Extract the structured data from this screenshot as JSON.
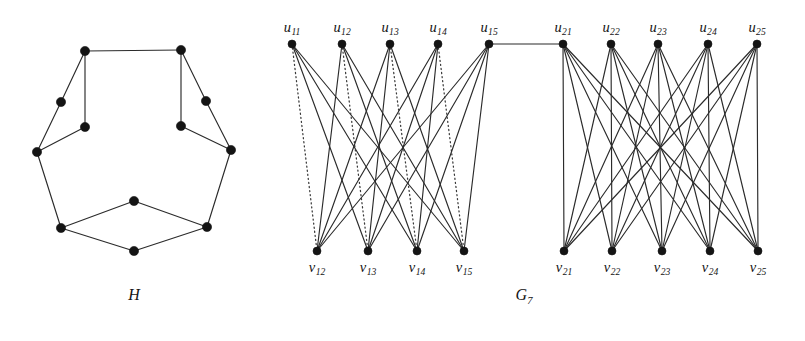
{
  "figure": {
    "background_color": "#ffffff",
    "vertex_color": "#141414",
    "edge_color": "#2b2b2b",
    "dotted_edge_color": "#3a3a3a",
    "width": 805,
    "height": 341
  },
  "captions": [
    {
      "id": "caption-H",
      "base": "H",
      "sub": "",
      "x": 134,
      "y": 286
    },
    {
      "id": "caption-G7",
      "base": "G",
      "sub": "7",
      "x": 524,
      "y": 286
    }
  ],
  "graph_H": {
    "name": "H",
    "caption_base": "H",
    "vertex_count": 12,
    "edge_count": 13,
    "vertices": [
      {
        "id": "h1",
        "x": 85,
        "y": 51
      },
      {
        "id": "h2",
        "x": 181,
        "y": 50
      },
      {
        "id": "h3",
        "x": 61,
        "y": 102
      },
      {
        "id": "h4",
        "x": 206,
        "y": 101
      },
      {
        "id": "h5",
        "x": 85,
        "y": 127
      },
      {
        "id": "h6",
        "x": 181,
        "y": 126
      },
      {
        "id": "h7",
        "x": 37,
        "y": 152
      },
      {
        "id": "h8",
        "x": 231,
        "y": 150
      },
      {
        "id": "h9",
        "x": 61,
        "y": 228
      },
      {
        "id": "h10",
        "x": 207,
        "y": 227
      },
      {
        "id": "h11",
        "x": 134,
        "y": 201
      },
      {
        "id": "h12",
        "x": 134,
        "y": 251
      }
    ],
    "edges": [
      {
        "from": "h1",
        "to": "h2",
        "style": "solid"
      },
      {
        "from": "h1",
        "to": "h3",
        "style": "solid"
      },
      {
        "from": "h1",
        "to": "h5",
        "style": "solid"
      },
      {
        "from": "h2",
        "to": "h4",
        "style": "solid"
      },
      {
        "from": "h2",
        "to": "h6",
        "style": "solid"
      },
      {
        "from": "h3",
        "to": "h7",
        "style": "solid"
      },
      {
        "from": "h5",
        "to": "h7",
        "style": "solid"
      },
      {
        "from": "h4",
        "to": "h8",
        "style": "solid"
      },
      {
        "from": "h6",
        "to": "h8",
        "style": "solid"
      },
      {
        "from": "h7",
        "to": "h9",
        "style": "solid"
      },
      {
        "from": "h8",
        "to": "h10",
        "style": "solid"
      },
      {
        "from": "h9",
        "to": "h11",
        "style": "solid"
      },
      {
        "from": "h9",
        "to": "h12",
        "style": "solid"
      },
      {
        "from": "h10",
        "to": "h11",
        "style": "solid"
      },
      {
        "from": "h10",
        "to": "h12",
        "style": "solid"
      }
    ]
  },
  "graph_G7": {
    "name": "G7",
    "caption_base": "G",
    "caption_sub": "7",
    "vertices": [
      {
        "id": "u11",
        "label_base": "u",
        "label_sub": "11",
        "x": 292,
        "y": 44,
        "label_x": 292,
        "label_y": 19,
        "group": "top-left"
      },
      {
        "id": "u12",
        "label_base": "u",
        "label_sub": "12",
        "x": 342,
        "y": 44,
        "label_x": 342,
        "label_y": 19,
        "group": "top-left"
      },
      {
        "id": "u13",
        "label_base": "u",
        "label_sub": "13",
        "x": 390,
        "y": 44,
        "label_x": 390,
        "label_y": 19,
        "group": "top-left"
      },
      {
        "id": "u14",
        "label_base": "u",
        "label_sub": "14",
        "x": 438,
        "y": 44,
        "label_x": 438,
        "label_y": 19,
        "group": "top-left"
      },
      {
        "id": "u15",
        "label_base": "u",
        "label_sub": "15",
        "x": 489,
        "y": 44,
        "label_x": 489,
        "label_y": 19,
        "group": "top-left"
      },
      {
        "id": "u21",
        "label_base": "u",
        "label_sub": "21",
        "x": 563,
        "y": 44,
        "label_x": 563,
        "label_y": 19,
        "group": "top-right"
      },
      {
        "id": "u22",
        "label_base": "u",
        "label_sub": "22",
        "x": 611,
        "y": 44,
        "label_x": 611,
        "label_y": 19,
        "group": "top-right"
      },
      {
        "id": "u23",
        "label_base": "u",
        "label_sub": "23",
        "x": 658,
        "y": 44,
        "label_x": 658,
        "label_y": 19,
        "group": "top-right"
      },
      {
        "id": "u24",
        "label_base": "u",
        "label_sub": "24",
        "x": 708,
        "y": 44,
        "label_x": 708,
        "label_y": 19,
        "group": "top-right"
      },
      {
        "id": "u25",
        "label_base": "u",
        "label_sub": "25",
        "x": 757,
        "y": 44,
        "label_x": 757,
        "label_y": 19,
        "group": "top-right"
      },
      {
        "id": "v12",
        "label_base": "v",
        "label_sub": "12",
        "x": 317,
        "y": 251,
        "label_x": 317,
        "label_y": 259,
        "group": "bottom-left"
      },
      {
        "id": "v13",
        "label_base": "v",
        "label_sub": "13",
        "x": 368,
        "y": 251,
        "label_x": 368,
        "label_y": 259,
        "group": "bottom-left"
      },
      {
        "id": "v14",
        "label_base": "v",
        "label_sub": "14",
        "x": 417,
        "y": 251,
        "label_x": 417,
        "label_y": 259,
        "group": "bottom-left"
      },
      {
        "id": "v15",
        "label_base": "v",
        "label_sub": "15",
        "x": 464,
        "y": 251,
        "label_x": 464,
        "label_y": 259,
        "group": "bottom-left"
      },
      {
        "id": "v21",
        "label_base": "v",
        "label_sub": "21",
        "x": 564,
        "y": 251,
        "label_x": 564,
        "label_y": 259,
        "group": "bottom-right"
      },
      {
        "id": "v22",
        "label_base": "v",
        "label_sub": "22",
        "x": 612,
        "y": 251,
        "label_x": 612,
        "label_y": 259,
        "group": "bottom-right"
      },
      {
        "id": "v23",
        "label_base": "v",
        "label_sub": "23",
        "x": 662,
        "y": 251,
        "label_x": 662,
        "label_y": 259,
        "group": "bottom-right"
      },
      {
        "id": "v24",
        "label_base": "v",
        "label_sub": "24",
        "x": 710,
        "y": 251,
        "label_x": 710,
        "label_y": 259,
        "group": "bottom-right"
      },
      {
        "id": "v25",
        "label_base": "v",
        "label_sub": "25",
        "x": 758,
        "y": 251,
        "label_x": 758,
        "label_y": 259,
        "group": "bottom-right"
      }
    ],
    "edges": [
      {
        "from": "u11",
        "to": "v12",
        "style": "dotted"
      },
      {
        "from": "u11",
        "to": "v13",
        "style": "solid"
      },
      {
        "from": "u11",
        "to": "v14",
        "style": "solid"
      },
      {
        "from": "u11",
        "to": "v15",
        "style": "solid"
      },
      {
        "from": "u12",
        "to": "v12",
        "style": "solid"
      },
      {
        "from": "u12",
        "to": "v13",
        "style": "dotted"
      },
      {
        "from": "u12",
        "to": "v14",
        "style": "solid"
      },
      {
        "from": "u12",
        "to": "v15",
        "style": "solid"
      },
      {
        "from": "u13",
        "to": "v12",
        "style": "solid"
      },
      {
        "from": "u13",
        "to": "v13",
        "style": "solid"
      },
      {
        "from": "u13",
        "to": "v14",
        "style": "dotted"
      },
      {
        "from": "u13",
        "to": "v15",
        "style": "solid"
      },
      {
        "from": "u14",
        "to": "v12",
        "style": "solid"
      },
      {
        "from": "u14",
        "to": "v13",
        "style": "solid"
      },
      {
        "from": "u14",
        "to": "v14",
        "style": "solid"
      },
      {
        "from": "u14",
        "to": "v15",
        "style": "dotted"
      },
      {
        "from": "u15",
        "to": "v12",
        "style": "solid"
      },
      {
        "from": "u15",
        "to": "v13",
        "style": "solid"
      },
      {
        "from": "u15",
        "to": "v14",
        "style": "solid"
      },
      {
        "from": "u15",
        "to": "v15",
        "style": "solid"
      },
      {
        "from": "u15",
        "to": "u21",
        "style": "solid"
      },
      {
        "from": "u21",
        "to": "v21",
        "style": "solid"
      },
      {
        "from": "u21",
        "to": "v22",
        "style": "solid"
      },
      {
        "from": "u21",
        "to": "v23",
        "style": "solid"
      },
      {
        "from": "u21",
        "to": "v24",
        "style": "solid"
      },
      {
        "from": "u21",
        "to": "v25",
        "style": "solid"
      },
      {
        "from": "u22",
        "to": "v21",
        "style": "solid"
      },
      {
        "from": "u22",
        "to": "v22",
        "style": "solid"
      },
      {
        "from": "u22",
        "to": "v23",
        "style": "solid"
      },
      {
        "from": "u22",
        "to": "v24",
        "style": "solid"
      },
      {
        "from": "u22",
        "to": "v25",
        "style": "solid"
      },
      {
        "from": "u23",
        "to": "v21",
        "style": "solid"
      },
      {
        "from": "u23",
        "to": "v22",
        "style": "solid"
      },
      {
        "from": "u23",
        "to": "v23",
        "style": "solid"
      },
      {
        "from": "u23",
        "to": "v24",
        "style": "solid"
      },
      {
        "from": "u23",
        "to": "v25",
        "style": "solid"
      },
      {
        "from": "u24",
        "to": "v21",
        "style": "solid"
      },
      {
        "from": "u24",
        "to": "v22",
        "style": "solid"
      },
      {
        "from": "u24",
        "to": "v23",
        "style": "solid"
      },
      {
        "from": "u24",
        "to": "v24",
        "style": "solid"
      },
      {
        "from": "u24",
        "to": "v25",
        "style": "solid"
      },
      {
        "from": "u25",
        "to": "v21",
        "style": "solid"
      },
      {
        "from": "u25",
        "to": "v22",
        "style": "solid"
      },
      {
        "from": "u25",
        "to": "v23",
        "style": "solid"
      },
      {
        "from": "u25",
        "to": "v24",
        "style": "solid"
      },
      {
        "from": "u25",
        "to": "v25",
        "style": "solid"
      }
    ]
  }
}
